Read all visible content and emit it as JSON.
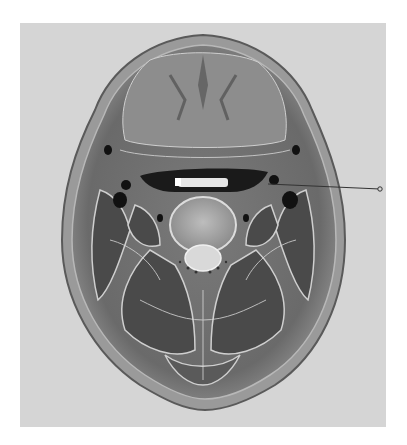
{
  "figure": {
    "background_color": "#d5d5d5",
    "page_color": "#ffffff",
    "leader_line": {
      "start": [
        268,
        184
      ],
      "end": [
        380,
        189
      ],
      "color": "#333333",
      "label": ""
    }
  }
}
